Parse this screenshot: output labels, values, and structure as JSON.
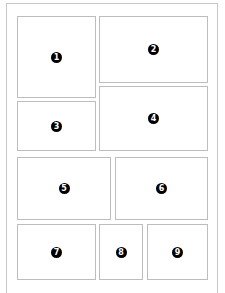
{
  "diagram": {
    "type": "comic-panel-layout",
    "panels": [
      {
        "number": "1"
      },
      {
        "number": "2"
      },
      {
        "number": "3"
      },
      {
        "number": "4"
      },
      {
        "number": "5"
      },
      {
        "number": "6"
      },
      {
        "number": "7"
      },
      {
        "number": "8"
      },
      {
        "number": "9"
      }
    ]
  }
}
